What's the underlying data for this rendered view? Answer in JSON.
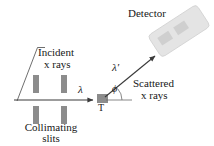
{
  "figure": {
    "background_color": "#ffffff",
    "ink_color": "#171717",
    "part_fill_color": "#8c8c8c",
    "detector_fill_color": "#e2e2e2",
    "detector_window_color": "#c9c9c9"
  },
  "labels": {
    "detector": "Detector",
    "incident": "Incident",
    "incident_xrays": "x rays",
    "scattered": "Scattered",
    "scattered_xrays": "x rays",
    "collimating": "Collimating",
    "slits": "slits",
    "target": "T",
    "lambda": "λ",
    "lambda_prime": "λ′",
    "phi": "ϕ"
  },
  "components": {
    "collimating_slits": {
      "count": 4,
      "bars": [
        {
          "x": 33,
          "y": 75,
          "width": 6,
          "height": 18
        },
        {
          "x": 61,
          "y": 75,
          "width": 6,
          "height": 18
        },
        {
          "x": 33,
          "y": 106,
          "width": 6,
          "height": 18
        },
        {
          "x": 61,
          "y": 106,
          "width": 6,
          "height": 18
        }
      ]
    },
    "target": {
      "x": 97,
      "y": 94,
      "width": 11,
      "height": 9
    },
    "detector": {
      "rotation_degrees": -33,
      "x": 150,
      "y": 18,
      "width": 58,
      "height": 26
    }
  },
  "rays": {
    "incident_beam": {
      "from_x": 14,
      "from_y": 100,
      "to_x": 96,
      "to_y": 100
    },
    "scattered_beam": {
      "from_x": 104,
      "from_y": 96,
      "to_x": 158,
      "to_y": 53
    },
    "angle_reference": {
      "from_x": 104,
      "from_y": 100,
      "to_x": 131,
      "to_y": 100
    },
    "angle_value_symbol": "ϕ",
    "leader_line": {
      "from_x": 21,
      "from_y": 101,
      "to_x": 38,
      "to_y": 49
    }
  }
}
